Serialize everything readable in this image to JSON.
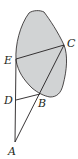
{
  "diagram": {
    "region_fill": "#d1d3d4",
    "stroke": "#231f20",
    "points": {
      "A": {
        "label": "A",
        "x": 15,
        "y": 142,
        "lx": 8,
        "ly": 155
      },
      "B": {
        "label": "B",
        "x": 40,
        "y": 94,
        "lx": 39,
        "ly": 106
      },
      "C": {
        "label": "C",
        "x": 64,
        "y": 45,
        "lx": 68,
        "ly": 46
      },
      "D": {
        "label": "D",
        "x": 16,
        "y": 100,
        "lx": 4,
        "ly": 104
      },
      "E": {
        "label": "E",
        "x": 16,
        "y": 59,
        "lx": 4,
        "ly": 64
      }
    }
  }
}
